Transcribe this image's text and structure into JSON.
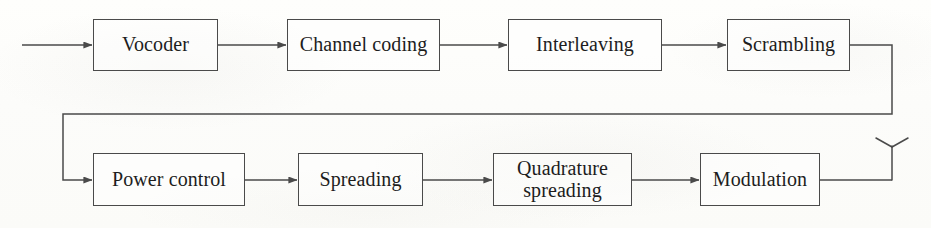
{
  "diagram": {
    "type": "block-diagram",
    "orientation": "left-to-right, two rows with wrap-around connector",
    "colors": {
      "background": "#fdfdfb",
      "line": "#4a4a4a",
      "text": "#1d1d1d"
    },
    "input": {
      "label": "",
      "arrow_from_x": 22,
      "arrow_to_x": 93,
      "y": 45
    },
    "nodes": [
      {
        "id": "vocoder",
        "label": "Vocoder",
        "row": 1,
        "order": 1,
        "x": 93,
        "y": 19,
        "w": 125,
        "h": 52
      },
      {
        "id": "channel-coding",
        "label": "Channel coding",
        "row": 1,
        "order": 2,
        "x": 287,
        "y": 19,
        "w": 153,
        "h": 52
      },
      {
        "id": "interleaving",
        "label": "Interleaving",
        "row": 1,
        "order": 3,
        "x": 508,
        "y": 19,
        "w": 154,
        "h": 52
      },
      {
        "id": "scrambling",
        "label": "Scrambling",
        "row": 1,
        "order": 4,
        "x": 727,
        "y": 19,
        "w": 123,
        "h": 52
      },
      {
        "id": "power-control",
        "label": "Power control",
        "row": 2,
        "order": 1,
        "x": 93,
        "y": 153,
        "w": 152,
        "h": 53
      },
      {
        "id": "spreading",
        "label": "Spreading",
        "row": 2,
        "order": 2,
        "x": 298,
        "y": 153,
        "w": 125,
        "h": 53
      },
      {
        "id": "quadrature-spreading",
        "label": "Quadrature\nspreading",
        "row": 2,
        "order": 3,
        "x": 493,
        "y": 153,
        "w": 139,
        "h": 53
      },
      {
        "id": "modulation",
        "label": "Modulation",
        "row": 2,
        "order": 4,
        "x": 700,
        "y": 153,
        "w": 120,
        "h": 53
      }
    ],
    "edges": [
      {
        "id": "edge-input-vocoder",
        "from": "input",
        "to": "vocoder",
        "kind": "arrow"
      },
      {
        "id": "edge-vocoder-channel-coding",
        "from": "vocoder",
        "to": "channel-coding",
        "kind": "arrow"
      },
      {
        "id": "edge-channel-coding-interleaving",
        "from": "channel-coding",
        "to": "interleaving",
        "kind": "arrow"
      },
      {
        "id": "edge-interleaving-scrambling",
        "from": "interleaving",
        "to": "scrambling",
        "kind": "arrow"
      },
      {
        "id": "edge-scrambling-power-control",
        "from": "scrambling",
        "to": "power-control",
        "kind": "wrap-arrow"
      },
      {
        "id": "edge-power-control-spreading",
        "from": "power-control",
        "to": "spreading",
        "kind": "arrow"
      },
      {
        "id": "edge-spreading-quadrature-spreading",
        "from": "spreading",
        "to": "quadrature-spreading",
        "kind": "arrow"
      },
      {
        "id": "edge-quadrature-spreading-modulation",
        "from": "quadrature-spreading",
        "to": "modulation",
        "kind": "arrow"
      },
      {
        "id": "edge-modulation-antenna",
        "from": "modulation",
        "to": "antenna",
        "kind": "plain"
      }
    ],
    "antenna": {
      "id": "antenna",
      "label": "",
      "stem_x": 892,
      "tip_y": 140,
      "base_y": 180
    }
  }
}
